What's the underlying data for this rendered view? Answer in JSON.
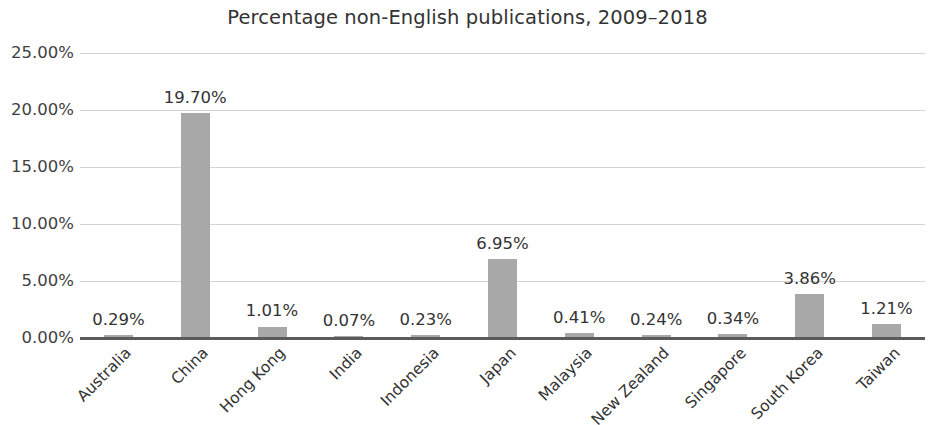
{
  "chart_data": {
    "type": "bar",
    "title": "Percentage non-English publications, 2009–2018",
    "xlabel": "",
    "ylabel": "",
    "ylim": [
      0,
      25
    ],
    "grid": true,
    "legend": "none",
    "orientation": "vertical",
    "bar_color": "#a8a8a8",
    "gridline_color": "#d4d4d4",
    "axis_color": "#5b5b5b",
    "categories": [
      "Australia",
      "China",
      "Hong Kong",
      "India",
      "Indonesia",
      "Japan",
      "Malaysia",
      "New Zealand",
      "Singapore",
      "South Korea",
      "Taiwan"
    ],
    "values": [
      0.29,
      19.7,
      1.01,
      0.07,
      0.23,
      6.95,
      0.41,
      0.24,
      0.34,
      3.86,
      1.21
    ],
    "value_labels": [
      "0.29%",
      "19.70%",
      "1.01%",
      "0.07%",
      "0.23%",
      "6.95%",
      "0.41%",
      "0.24%",
      "0.34%",
      "3.86%",
      "1.21%"
    ],
    "ytick_values": [
      25,
      20,
      15,
      10,
      5,
      0
    ],
    "ytick_labels": [
      "25.00%",
      "20.00%",
      "15.00%",
      "10.00%",
      "5.00%",
      "0.00%"
    ]
  }
}
